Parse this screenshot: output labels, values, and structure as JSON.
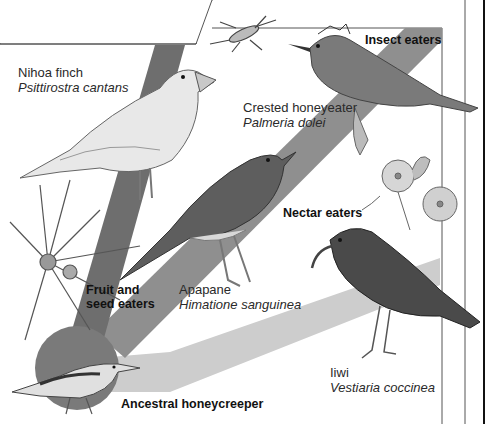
{
  "diagram": {
    "root": {
      "label": "Ancestral honeycreeper"
    },
    "groups": [
      {
        "id": "fruit-seed",
        "label_line1": "Fruit and",
        "label_line2": "seed eaters",
        "band_color": "#6e6e6e"
      },
      {
        "id": "insect",
        "label": "Insect eaters",
        "band_color": "#8f8f8f"
      },
      {
        "id": "nectar",
        "label": "Nectar eaters",
        "band_color": "#c9c9c9"
      }
    ],
    "species": [
      {
        "common": "Nihoa finch",
        "scientific": "Psittirostra cantans",
        "group": "fruit-seed"
      },
      {
        "common": "Crested honeyeater",
        "scientific": "Palmeria dolei",
        "group": "insect"
      },
      {
        "common": "Apapane",
        "scientific": "Himatione sanguinea",
        "group": "nectar"
      },
      {
        "common": "Iiwi",
        "scientific": "Vestiaria coccinea",
        "group": "nectar"
      }
    ],
    "illustrations": [
      "insect",
      "flowers",
      "spiky-fruit-plant"
    ],
    "colors": {
      "background": "#ffffff",
      "root_circle": "#7a7a7a",
      "band_dark": "#6e6e6e",
      "band_mid": "#8f8f8f",
      "band_light": "#cdcdcd",
      "frame_line": "#555555"
    }
  }
}
